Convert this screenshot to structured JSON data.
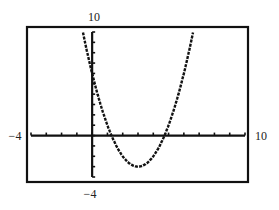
{
  "chart_data": {
    "type": "line",
    "title": "",
    "xlabel": "",
    "ylabel": "",
    "xlim": [
      -4,
      10
    ],
    "ylim": [
      -4,
      10
    ],
    "x_tick_step": 1,
    "y_tick_step": 1,
    "grid": false,
    "window_labels": {
      "xmin": "−4",
      "xmax": "10",
      "ymin": "−4",
      "ymax": "10"
    },
    "series": [
      {
        "name": "y = x^2 - 6x + 6",
        "style": "dotted-pixel",
        "x": [
          -0.6,
          0,
          0.5,
          1,
          1.27,
          1.5,
          2,
          2.5,
          3,
          3.5,
          4,
          4.5,
          4.73,
          5,
          5.5,
          6,
          6.6
        ],
        "y": [
          10,
          6,
          3.25,
          1,
          0,
          -0.75,
          -2,
          -2.75,
          -3,
          -2.75,
          -2,
          -0.75,
          0,
          1,
          3.25,
          6,
          10
        ]
      }
    ],
    "key_points": {
      "vertex": [
        3,
        -3
      ],
      "x_intercepts": [
        1.27,
        4.73
      ],
      "y_intercept": 6
    }
  },
  "colors": {
    "axis": "#111111",
    "curve": "#111111",
    "frame": "#111111",
    "background": "#ffffff"
  }
}
